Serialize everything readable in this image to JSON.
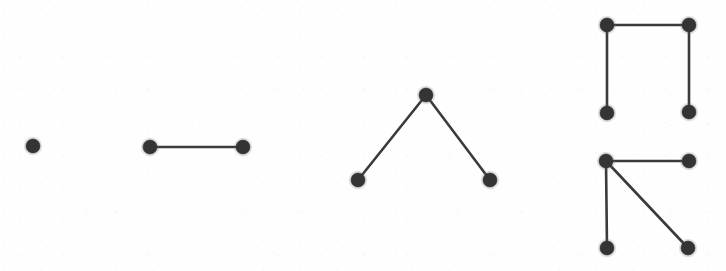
{
  "figure": {
    "title": "",
    "background_color": "#fefefe",
    "node_color": "#343434",
    "edge_color": "#3b3b3b",
    "node_radius": 7,
    "edge_width": 2.6,
    "width": 726,
    "height": 271
  },
  "chart_data": {
    "type": "diagram",
    "subtype": "graph-collection",
    "title": "",
    "xlabel": "",
    "ylabel": "",
    "grid": false,
    "legend": false,
    "xlim": [
      0,
      726
    ],
    "ylim": [
      0,
      271
    ],
    "graph_count": 5,
    "graphs": [
      {
        "id": "graph-1",
        "name": "single-vertex",
        "node_count": 1,
        "edge_count": 1e-12,
        "nodes": [
          {
            "id": "g1n1",
            "x": 33,
            "y": 146
          }
        ],
        "edges": []
      },
      {
        "id": "graph-2",
        "name": "single-edge",
        "node_count": 2,
        "edge_count": 1,
        "nodes": [
          {
            "id": "g2n1",
            "x": 150,
            "y": 147
          },
          {
            "id": "g2n2",
            "x": 243,
            "y": 147
          }
        ],
        "edges": [
          {
            "from": "g2n1",
            "to": "g2n2"
          }
        ]
      },
      {
        "id": "graph-3",
        "name": "path-three-vertices",
        "node_count": 3,
        "edge_count": 2,
        "nodes": [
          {
            "id": "g3n1",
            "x": 358,
            "y": 180
          },
          {
            "id": "g3n2",
            "x": 426,
            "y": 95
          },
          {
            "id": "g3n3",
            "x": 490,
            "y": 180
          }
        ],
        "edges": [
          {
            "from": "g3n1",
            "to": "g3n2"
          },
          {
            "from": "g3n2",
            "to": "g3n3"
          }
        ]
      },
      {
        "id": "graph-4",
        "name": "path-four-vertices",
        "node_count": 4,
        "edge_count": 3,
        "nodes": [
          {
            "id": "g4n1",
            "x": 607,
            "y": 25
          },
          {
            "id": "g4n2",
            "x": 689,
            "y": 25
          },
          {
            "id": "g4n3",
            "x": 607,
            "y": 113
          },
          {
            "id": "g4n4",
            "x": 689,
            "y": 112
          }
        ],
        "edges": [
          {
            "from": "g4n1",
            "to": "g4n2"
          },
          {
            "from": "g4n1",
            "to": "g4n3"
          },
          {
            "from": "g4n2",
            "to": "g4n4"
          }
        ]
      },
      {
        "id": "graph-5",
        "name": "star-three-leaves",
        "node_count": 4,
        "edge_count": 3,
        "nodes": [
          {
            "id": "g5n1",
            "x": 606,
            "y": 161
          },
          {
            "id": "g5n2",
            "x": 689,
            "y": 161
          },
          {
            "id": "g5n3",
            "x": 607,
            "y": 248
          },
          {
            "id": "g5n4",
            "x": 688,
            "y": 248
          }
        ],
        "edges": [
          {
            "from": "g5n1",
            "to": "g5n2"
          },
          {
            "from": "g5n1",
            "to": "g5n3"
          },
          {
            "from": "g5n1",
            "to": "g5n4"
          }
        ]
      }
    ]
  }
}
